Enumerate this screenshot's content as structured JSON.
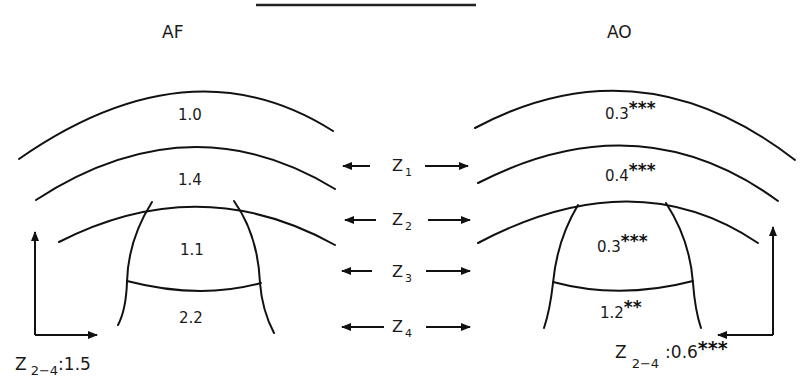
{
  "figure": {
    "title_underline": true,
    "panels": {
      "left": {
        "label": "AF",
        "zones": [
          {
            "id": "z1",
            "value": "1.0",
            "sig": ""
          },
          {
            "id": "z2",
            "value": "1.4",
            "sig": ""
          },
          {
            "id": "z3",
            "value": "1.1",
            "sig": ""
          },
          {
            "id": "z4",
            "value": "2.2",
            "sig": ""
          }
        ],
        "ratio": {
          "symbol": "Z",
          "sub": "2−4",
          "value": ":1.5",
          "sig": ""
        }
      },
      "right": {
        "label": "AO",
        "zones": [
          {
            "id": "z1",
            "value": "0.3",
            "sig": "***"
          },
          {
            "id": "z2",
            "value": "0.4",
            "sig": "***"
          },
          {
            "id": "z3",
            "value": "0.3",
            "sig": "***"
          },
          {
            "id": "z4",
            "value": "1.2",
            "sig": "**"
          }
        ],
        "ratio": {
          "symbol": "Z",
          "sub": "2−4",
          "value": ":0.6",
          "sig": "***"
        }
      }
    },
    "center_zone_labels": [
      {
        "symbol": "Z",
        "sub": "1"
      },
      {
        "symbol": "Z",
        "sub": "2"
      },
      {
        "symbol": "Z",
        "sub": "3"
      },
      {
        "symbol": "Z",
        "sub": "4"
      }
    ]
  }
}
